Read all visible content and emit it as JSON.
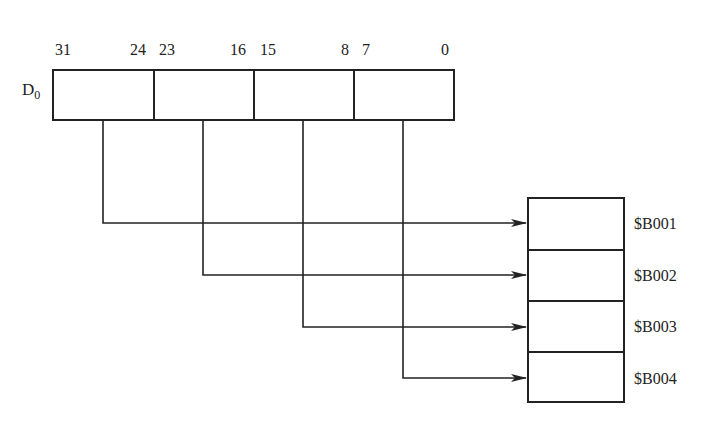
{
  "register": {
    "name": "D",
    "subscript": "0",
    "bit_labels": [
      "31",
      "24",
      "23",
      "16",
      "15",
      "8",
      "7",
      "0"
    ],
    "bytes": [
      {
        "bits": "31-24"
      },
      {
        "bits": "23-16"
      },
      {
        "bits": "15-8"
      },
      {
        "bits": "7-0"
      }
    ]
  },
  "memory": {
    "addresses": [
      "$B001",
      "$B002",
      "$B003",
      "$B004"
    ]
  },
  "mapping": [
    {
      "from_byte": "31-24",
      "to": "$B001"
    },
    {
      "from_byte": "23-16",
      "to": "$B002"
    },
    {
      "from_byte": "15-8",
      "to": "$B003"
    },
    {
      "from_byte": "7-0",
      "to": "$B004"
    }
  ],
  "colors": {
    "line": "#222222",
    "background": "#ffffff"
  }
}
